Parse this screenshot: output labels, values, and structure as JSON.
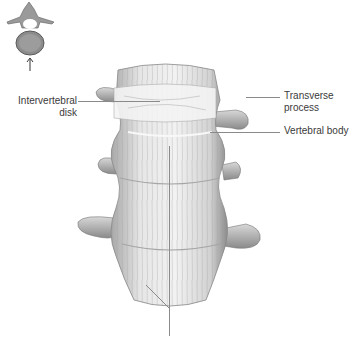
{
  "figure": {
    "inset": {
      "icon": "vertebra-top-view-icon",
      "arrow": "up-arrow-icon"
    },
    "labels": {
      "intervertebral_disk_line1": "Intervertebral",
      "intervertebral_disk_line2": "disk",
      "transverse_process_line1": "Transverse",
      "transverse_process_line2": "process",
      "vertebral_body": "Vertebral  body"
    },
    "colors": {
      "bone_light": "#ebebeb",
      "bone_mid": "#c9c9c9",
      "bone_dark": "#8f8f8f",
      "leader": "#8a8a8a",
      "text": "#3a3a3a"
    }
  }
}
